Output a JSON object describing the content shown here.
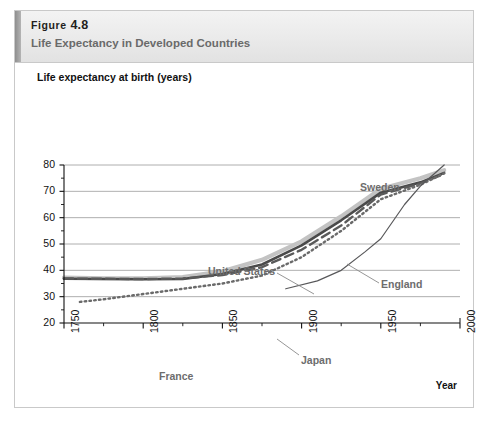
{
  "figure": {
    "number_word": "Figure",
    "number": "4.8",
    "caption": "Life Expectancy in Developed Countries"
  },
  "chart_data": {
    "type": "line",
    "title": "Life Expectancy in Developed Countries",
    "xlabel": "Year",
    "ylabel": "Life expectancy at birth (years)",
    "xlim": [
      1750,
      2000
    ],
    "ylim": [
      20,
      80
    ],
    "xticks": [
      "1750",
      "1800",
      "1850",
      "1900",
      "1950",
      "2000"
    ],
    "xtick_values": [
      1750,
      1800,
      1850,
      1900,
      1950,
      2000
    ],
    "xminor_step": 25,
    "yticks": [
      "20",
      "30",
      "40",
      "50",
      "60",
      "70",
      "80"
    ],
    "ytick_values": [
      20,
      30,
      40,
      50,
      60,
      70,
      80
    ],
    "yminor_step": 5,
    "grid": "horizontal",
    "legend": "inline-annotations",
    "series": [
      {
        "name": "Sweden",
        "style": "solid-thick-light",
        "color": "#c3c3c3",
        "width": 4.2,
        "x": [
          1750,
          1775,
          1800,
          1825,
          1850,
          1875,
          1900,
          1925,
          1950,
          1975,
          1990
        ],
        "y": [
          37.2,
          37.0,
          37.0,
          37.4,
          39.6,
          44.0,
          51.0,
          60.5,
          71.0,
          75.0,
          78.0
        ]
      },
      {
        "name": "United States",
        "style": "solid",
        "color": "#4a4a4a",
        "width": 2.6,
        "x": [
          1750,
          1775,
          1800,
          1825,
          1850,
          1875,
          1900,
          1925,
          1950,
          1975,
          1990
        ],
        "y": [
          36.8,
          36.7,
          36.6,
          36.7,
          38.6,
          42.2,
          49.5,
          59.0,
          69.5,
          73.4,
          77.0
        ]
      },
      {
        "name": "England",
        "style": "dashed",
        "color": "#5a5a5a",
        "width": 2.4,
        "x": [
          1750,
          1775,
          1800,
          1825,
          1850,
          1875,
          1900,
          1925,
          1950,
          1975,
          1990
        ],
        "y": [
          36.9,
          36.8,
          36.7,
          36.9,
          38.2,
          41.2,
          47.8,
          57.0,
          68.8,
          73.0,
          76.6
        ]
      },
      {
        "name": "France",
        "style": "dotted",
        "color": "#6a6a6a",
        "width": 2.4,
        "x": [
          1760,
          1775,
          1800,
          1825,
          1850,
          1875,
          1900,
          1925,
          1950,
          1975,
          1990
        ],
        "y": [
          28.0,
          29.0,
          31.0,
          33.0,
          35.0,
          38.0,
          45.0,
          55.0,
          67.0,
          72.5,
          76.8
        ]
      },
      {
        "name": "Japan",
        "style": "solid-thin",
        "color": "#58585a",
        "width": 1.2,
        "x": [
          1890,
          1910,
          1925,
          1940,
          1950,
          1965,
          1975,
          1990
        ],
        "y": [
          33.0,
          36.0,
          40.0,
          47.0,
          52.0,
          65.0,
          72.0,
          80.0
        ]
      }
    ],
    "annotations": [
      {
        "text": "Sweden",
        "x_px": 345,
        "y_px": 118,
        "leader": null
      },
      {
        "text": "United States",
        "x_px": 193,
        "y_px": 202,
        "leader": {
          "x1": 262,
          "y1": 210,
          "x2": 299,
          "y2": 231
        }
      },
      {
        "text": "England",
        "x_px": 366,
        "y_px": 215,
        "leader": {
          "x1": 364,
          "y1": 220,
          "x2": 332,
          "y2": 201
        }
      },
      {
        "text": "France",
        "x_px": 144,
        "y_px": 307,
        "leader": null
      },
      {
        "text": "Japan",
        "x_px": 286,
        "y_px": 291,
        "leader": {
          "x1": 284,
          "y1": 292,
          "x2": 262,
          "y2": 276
        }
      }
    ]
  },
  "source_note": ""
}
